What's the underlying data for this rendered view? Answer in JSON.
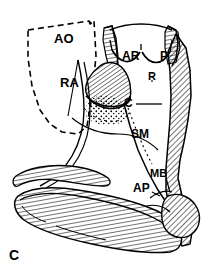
{
  "figure": {
    "panel_label": "C",
    "type": "anatomical-line-drawing",
    "background_color": "#ffffff",
    "ink_color": "#000000"
  },
  "labels": [
    {
      "id": "ao",
      "text": "AO",
      "meaning": "aorta",
      "x": 54,
      "y": 32,
      "style": "bold"
    },
    {
      "id": "ra",
      "text": "RA",
      "meaning": "right atrium",
      "x": 60,
      "y": 76,
      "style": "bold"
    },
    {
      "id": "ar",
      "text": "AR",
      "meaning": "anterior-right cusp",
      "x": 122,
      "y": 50,
      "style": "bold"
    },
    {
      "id": "p",
      "text": "P",
      "meaning": "posterior cusp",
      "x": 160,
      "y": 50,
      "style": "bold"
    },
    {
      "id": "r",
      "text": "R",
      "meaning": "right cusp",
      "x": 148,
      "y": 71,
      "style": "bold"
    },
    {
      "id": "c",
      "text": "C",
      "meaning": "crista",
      "x": 124,
      "y": 97,
      "style": "bold"
    },
    {
      "id": "sm",
      "text": "SM",
      "meaning": "septomarginal trabecula",
      "x": 131,
      "y": 128,
      "style": "bold"
    },
    {
      "id": "mb",
      "text": "MB",
      "meaning": "moderator band",
      "x": 150,
      "y": 168,
      "style": "bold"
    },
    {
      "id": "ap",
      "text": "AP",
      "meaning": "anterior papillary muscle",
      "x": 133,
      "y": 182,
      "style": "bold"
    }
  ],
  "regions": [
    {
      "id": "aorta-outline",
      "render": "dashed-quadrilateral",
      "fill": "none"
    },
    {
      "id": "right-wall",
      "render": "hatched",
      "fill": "diagonal-hatch"
    },
    {
      "id": "valve-cusps",
      "render": "scalloped-arcs",
      "fill": "none"
    },
    {
      "id": "crista-leaflet",
      "render": "hatched",
      "fill": "diagonal-hatch"
    },
    {
      "id": "stipple-patch",
      "render": "stippled",
      "fill": "dots"
    },
    {
      "id": "trabecular-band",
      "render": "hatched-ribbon",
      "fill": "cross-hatch"
    },
    {
      "id": "papillary-mass",
      "render": "hatched-rounded",
      "fill": "diagonal-hatch"
    }
  ],
  "leaders": [
    {
      "id": "leader-c",
      "from": "c",
      "direction": "right"
    },
    {
      "id": "leader-r",
      "from": "r",
      "direction": "up",
      "style": "dotted"
    },
    {
      "id": "leader-sm",
      "from": "sm",
      "direction": "down",
      "style": "dotted"
    },
    {
      "id": "leader-mb",
      "from": "mb",
      "direction": "down"
    }
  ]
}
